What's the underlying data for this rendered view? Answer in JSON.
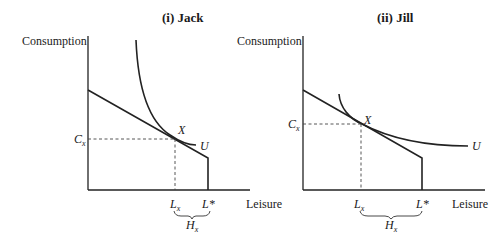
{
  "panels": [
    {
      "title": "(i)  Jack",
      "y_axis_label": "Consumption",
      "x_axis_label": "Leisure",
      "point_label": "X",
      "curve_label": "U",
      "c_label": "C",
      "c_sub": "x",
      "lx_label": "L",
      "lx_sub": "x",
      "lstar_label": "L*",
      "h_label": "H",
      "h_sub": "x"
    },
    {
      "title": "(ii)  Jill",
      "y_axis_label": "Consumption",
      "x_axis_label": "Leisure",
      "point_label": "X",
      "curve_label": "U",
      "c_label": "C",
      "c_sub": "x",
      "lx_label": "L",
      "lx_sub": "x",
      "lstar_label": "L*",
      "h_label": "H",
      "h_sub": "x"
    }
  ]
}
